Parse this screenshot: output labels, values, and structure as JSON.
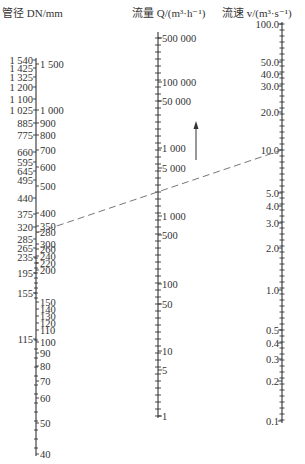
{
  "chart_data": {
    "type": "nomogram",
    "title": "",
    "scales": [
      {
        "id": "dn",
        "header": "管径 DN/mm",
        "left_labels": [
          {
            "text": "1 540",
            "y": 60
          },
          {
            "text": "1 425",
            "y": 68
          },
          {
            "text": "1 325",
            "y": 77
          },
          {
            "text": "1 200",
            "y": 87
          },
          {
            "text": "1 100",
            "y": 99
          },
          {
            "text": "1 025",
            "y": 110
          },
          {
            "text": "885",
            "y": 123
          },
          {
            "text": "775",
            "y": 135
          },
          {
            "text": "660",
            "y": 152
          },
          {
            "text": "595",
            "y": 162
          },
          {
            "text": "645",
            "y": 171
          },
          {
            "text": "495",
            "y": 180
          },
          {
            "text": "440",
            "y": 198
          },
          {
            "text": "375",
            "y": 214
          },
          {
            "text": "320",
            "y": 227
          },
          {
            "text": "285",
            "y": 239
          },
          {
            "text": "265",
            "y": 248
          },
          {
            "text": "235",
            "y": 257
          },
          {
            "text": "195",
            "y": 273
          },
          {
            "text": "155",
            "y": 293
          },
          {
            "text": "115",
            "y": 339
          }
        ],
        "right_labels": [
          {
            "text": "1 500",
            "y": 64
          },
          {
            "text": "1 000",
            "y": 110
          },
          {
            "text": "900",
            "y": 123
          },
          {
            "text": "800",
            "y": 135
          },
          {
            "text": "700",
            "y": 150
          },
          {
            "text": "600",
            "y": 167
          },
          {
            "text": "500",
            "y": 186
          },
          {
            "text": "400",
            "y": 213
          },
          {
            "text": "350",
            "y": 226
          },
          {
            "text": "300",
            "y": 244
          },
          {
            "text": "280",
            "y": 232
          },
          {
            "text": "260",
            "y": 249
          },
          {
            "text": "240",
            "y": 256
          },
          {
            "text": "220",
            "y": 263
          },
          {
            "text": "200",
            "y": 270
          },
          {
            "text": "150",
            "y": 302
          },
          {
            "text": "140",
            "y": 309
          },
          {
            "text": "130",
            "y": 316
          },
          {
            "text": "120",
            "y": 323
          },
          {
            "text": "110",
            "y": 330
          },
          {
            "text": "100",
            "y": 342
          },
          {
            "text": "90",
            "y": 353
          },
          {
            "text": "80",
            "y": 366
          },
          {
            "text": "70",
            "y": 381
          },
          {
            "text": "60",
            "y": 398
          },
          {
            "text": "50",
            "y": 423
          },
          {
            "text": "40",
            "y": 454
          }
        ]
      },
      {
        "id": "flow",
        "header": "流量 Q/(m³·h⁻¹)",
        "labels": [
          {
            "text": "500 000",
            "y": 38
          },
          {
            "text": "100 000",
            "y": 82
          },
          {
            "text": "50 000",
            "y": 101
          },
          {
            "text": "1 000",
            "y": 148
          },
          {
            "text": "5 000",
            "y": 168
          },
          {
            "text": "1 000",
            "y": 216
          },
          {
            "text": "500",
            "y": 235
          },
          {
            "text": "100",
            "y": 284
          },
          {
            "text": "50",
            "y": 304
          },
          {
            "text": "10",
            "y": 351
          },
          {
            "text": "5",
            "y": 370
          },
          {
            "text": "1",
            "y": 416
          }
        ]
      },
      {
        "id": "velocity",
        "header": "流速 v/(m³·s⁻¹)",
        "labels": [
          {
            "text": "100.0",
            "y": 24
          },
          {
            "text": "50.0",
            "y": 62
          },
          {
            "text": "40.0",
            "y": 74
          },
          {
            "text": "30.0",
            "y": 86
          },
          {
            "text": "20.0",
            "y": 112
          },
          {
            "text": "10.0",
            "y": 150
          },
          {
            "text": "5.0",
            "y": 193
          },
          {
            "text": "4.0",
            "y": 206
          },
          {
            "text": "3.0",
            "y": 223
          },
          {
            "text": "2.0",
            "y": 248
          },
          {
            "text": "1.0",
            "y": 290
          },
          {
            "text": "0.5",
            "y": 330
          },
          {
            "text": "0.4",
            "y": 343
          },
          {
            "text": "0.3",
            "y": 359
          },
          {
            "text": "0.2",
            "y": 381
          },
          {
            "text": "0.1",
            "y": 421
          }
        ]
      }
    ],
    "annotations": [
      {
        "type": "dashed-line",
        "from": {
          "scale": "dn",
          "value": "280"
        },
        "to": {
          "scale": "velocity",
          "value": "10.0"
        }
      },
      {
        "type": "arrow-up",
        "near": "flow 1 000–5 000"
      }
    ]
  }
}
